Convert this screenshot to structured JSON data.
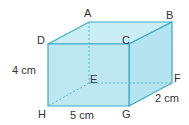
{
  "diagram": {
    "type": "cuboid",
    "colors": {
      "fill": "#bfe9f2",
      "fill_side": "#aee2ee",
      "edge": "#3aa9c6",
      "hidden_edge": "#5ab8d0",
      "text": "#333333"
    },
    "vertices": {
      "A": "A",
      "B": "B",
      "C": "C",
      "D": "D",
      "E": "E",
      "F": "F",
      "G": "G",
      "H": "H"
    },
    "dimensions": {
      "height": "4 cm",
      "length": "5 cm",
      "width": "2 cm"
    }
  }
}
